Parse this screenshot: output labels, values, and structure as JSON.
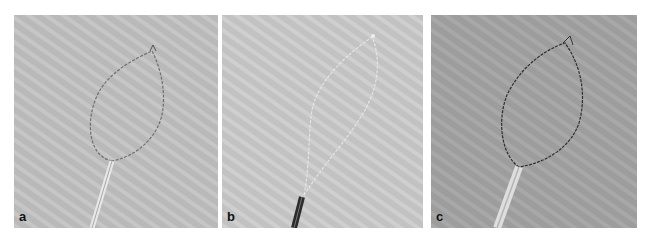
{
  "figure": {
    "panels": [
      {
        "label": "a",
        "background": "#b9b9b9",
        "description": "snare loop open, light sheath"
      },
      {
        "label": "b",
        "background": "#c2c2c2",
        "description": "snare loop deformed, dark sheath"
      },
      {
        "label": "c",
        "background": "#9d9d9d",
        "description": "snare loop open, dark wire, light sheath"
      }
    ]
  }
}
